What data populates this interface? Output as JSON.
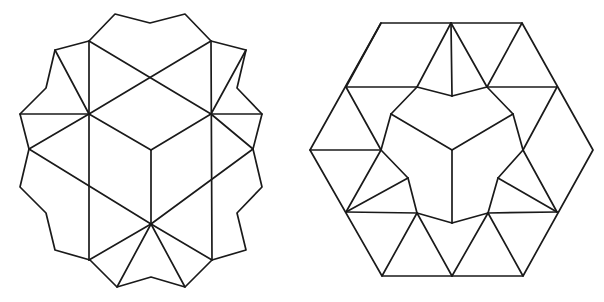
{
  "figures": [
    {
      "id": "left-dodecagon-tiling",
      "description": "Twelve-sided star-like polygon dissected into triangles and rhombi with a central cube",
      "stroke_color": "#1a1a1a",
      "outline": [
        [
          115,
          14
        ],
        [
          150,
          23
        ],
        [
          185,
          14
        ],
        [
          211,
          41
        ],
        [
          246,
          50
        ],
        [
          237,
          88
        ],
        [
          262,
          114
        ],
        [
          253,
          149
        ],
        [
          262,
          187
        ],
        [
          237,
          213
        ],
        [
          246,
          250
        ],
        [
          212,
          260
        ],
        [
          185,
          287
        ],
        [
          151,
          277
        ],
        [
          117,
          287
        ],
        [
          90,
          260
        ],
        [
          55,
          250
        ],
        [
          46,
          213
        ],
        [
          20,
          187
        ],
        [
          29,
          149
        ],
        [
          20,
          114
        ],
        [
          46,
          88
        ],
        [
          55,
          50
        ],
        [
          89,
          41
        ]
      ],
      "segments": [
        [
          [
            89,
            41
          ],
          [
            89,
            260
          ]
        ],
        [
          [
            211,
            41
          ],
          [
            212,
            260
          ]
        ],
        [
          [
            89,
            41
          ],
          [
            211,
            114
          ]
        ],
        [
          [
            211,
            41
          ],
          [
            89,
            114
          ]
        ],
        [
          [
            89,
            114
          ],
          [
            151,
            150
          ]
        ],
        [
          [
            211,
            114
          ],
          [
            151,
            150
          ]
        ],
        [
          [
            151,
            150
          ],
          [
            151,
            224
          ]
        ],
        [
          [
            29,
            149
          ],
          [
            151,
            224
          ]
        ],
        [
          [
            253,
            149
          ],
          [
            151,
            224
          ]
        ],
        [
          [
            89,
            114
          ],
          [
            29,
            149
          ]
        ],
        [
          [
            211,
            114
          ],
          [
            253,
            149
          ]
        ],
        [
          [
            20,
            114
          ],
          [
            89,
            114
          ]
        ],
        [
          [
            211,
            114
          ],
          [
            262,
            114
          ]
        ],
        [
          [
            55,
            50
          ],
          [
            89,
            114
          ]
        ],
        [
          [
            246,
            50
          ],
          [
            211,
            114
          ]
        ],
        [
          [
            89,
            260
          ],
          [
            151,
            224
          ]
        ],
        [
          [
            212,
            260
          ],
          [
            151,
            224
          ]
        ],
        [
          [
            117,
            287
          ],
          [
            151,
            224
          ]
        ],
        [
          [
            185,
            287
          ],
          [
            151,
            224
          ]
        ]
      ]
    },
    {
      "id": "right-hexagon-tiling",
      "description": "Regular hexagon dissected into triangles and rhombi around a central three-rhombus cube with notched boundary",
      "stroke_color": "#1a1a1a",
      "outline": [
        [
          381,
          23
        ],
        [
          522,
          23
        ],
        [
          593,
          150
        ],
        [
          523,
          276
        ],
        [
          382,
          276
        ],
        [
          310,
          150
        ]
      ],
      "segments": [
        [
          [
            451,
            23
          ],
          [
            452,
            96
          ]
        ],
        [
          [
            451,
            23
          ],
          [
            417,
            87
          ]
        ],
        [
          [
            451,
            23
          ],
          [
            487,
            87
          ]
        ],
        [
          [
            522,
            23
          ],
          [
            487,
            87
          ]
        ],
        [
          [
            381,
            23
          ],
          [
            346,
            87
          ]
        ],
        [
          [
            346,
            87
          ],
          [
            417,
            87
          ]
        ],
        [
          [
            487,
            87
          ],
          [
            557,
            87
          ]
        ],
        [
          [
            417,
            87
          ],
          [
            452,
            96
          ]
        ],
        [
          [
            487,
            87
          ],
          [
            452,
            96
          ]
        ],
        [
          [
            417,
            87
          ],
          [
            391,
            114
          ]
        ],
        [
          [
            487,
            87
          ],
          [
            513,
            114
          ]
        ],
        [
          [
            391,
            114
          ],
          [
            452,
            150
          ]
        ],
        [
          [
            513,
            114
          ],
          [
            452,
            150
          ]
        ],
        [
          [
            452,
            150
          ],
          [
            452,
            223
          ]
        ],
        [
          [
            391,
            114
          ],
          [
            381,
            150
          ]
        ],
        [
          [
            513,
            114
          ],
          [
            523,
            150
          ]
        ],
        [
          [
            346,
            87
          ],
          [
            381,
            150
          ]
        ],
        [
          [
            557,
            87
          ],
          [
            523,
            150
          ]
        ],
        [
          [
            310,
            150
          ],
          [
            381,
            150
          ]
        ],
        [
          [
            381,
            150
          ],
          [
            346,
            212
          ]
        ],
        [
          [
            381,
            150
          ],
          [
            408,
            178
          ]
        ],
        [
          [
            523,
            150
          ],
          [
            557,
            212
          ]
        ],
        [
          [
            523,
            150
          ],
          [
            498,
            178
          ]
        ],
        [
          [
            408,
            178
          ],
          [
            346,
            212
          ]
        ],
        [
          [
            498,
            178
          ],
          [
            557,
            212
          ]
        ],
        [
          [
            408,
            178
          ],
          [
            417,
            213
          ]
        ],
        [
          [
            498,
            178
          ],
          [
            488,
            213
          ]
        ],
        [
          [
            346,
            212
          ],
          [
            417,
            213
          ]
        ],
        [
          [
            488,
            213
          ],
          [
            557,
            212
          ]
        ],
        [
          [
            417,
            213
          ],
          [
            452,
            223
          ]
        ],
        [
          [
            488,
            213
          ],
          [
            452,
            223
          ]
        ],
        [
          [
            417,
            213
          ],
          [
            382,
            276
          ]
        ],
        [
          [
            417,
            213
          ],
          [
            452,
            276
          ]
        ],
        [
          [
            488,
            213
          ],
          [
            452,
            276
          ]
        ],
        [
          [
            488,
            213
          ],
          [
            523,
            276
          ]
        ]
      ]
    }
  ]
}
